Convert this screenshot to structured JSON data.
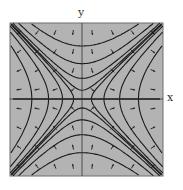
{
  "figure": {
    "title": "",
    "type": "phase-portrait",
    "x_label": "x",
    "y_label": "y",
    "colors": {
      "plot_background": "#b3b3b3",
      "border": "#6e6e6e",
      "trajectory": "#1a1a1a",
      "arrow": "#2a2a2a",
      "axis": "#333333"
    },
    "plot_box": {
      "left": 10,
      "top": 23,
      "right": 163,
      "bottom": 176
    },
    "origin": {
      "x": 82,
      "y": 99
    },
    "trajectory_levels": [
      0.15,
      0.35,
      0.6,
      0.9
    ],
    "arrow_grid": {
      "cols": 8,
      "rows": 8
    }
  }
}
